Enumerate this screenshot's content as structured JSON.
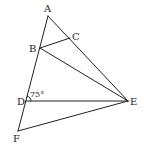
{
  "diagram": {
    "type": "geometry",
    "points": {
      "A": {
        "x": 48,
        "y": 16,
        "label": "A",
        "lx": 47,
        "ly": 12
      },
      "B": {
        "x": 40,
        "y": 48,
        "label": "B",
        "lx": 34,
        "ly": 51
      },
      "C": {
        "x": 70,
        "y": 38,
        "label": "C",
        "lx": 76,
        "ly": 40
      },
      "D": {
        "x": 26,
        "y": 101,
        "label": "D",
        "lx": 22,
        "ly": 104
      },
      "E": {
        "x": 128,
        "y": 101,
        "label": "E",
        "lx": 134,
        "ly": 104
      },
      "F": {
        "x": 18,
        "y": 131,
        "label": "F",
        "lx": 17,
        "ly": 141
      }
    },
    "segments": [
      {
        "from": "A",
        "to": "F"
      },
      {
        "from": "A",
        "to": "E"
      },
      {
        "from": "B",
        "to": "C"
      },
      {
        "from": "B",
        "to": "E"
      },
      {
        "from": "D",
        "to": "E"
      },
      {
        "from": "F",
        "to": "E"
      }
    ],
    "angle_label": {
      "text": "75°",
      "x": 31,
      "y": 97,
      "at": "D"
    },
    "colors": {
      "line": "#222222",
      "text": "#222222",
      "background": "#ffffff"
    }
  }
}
